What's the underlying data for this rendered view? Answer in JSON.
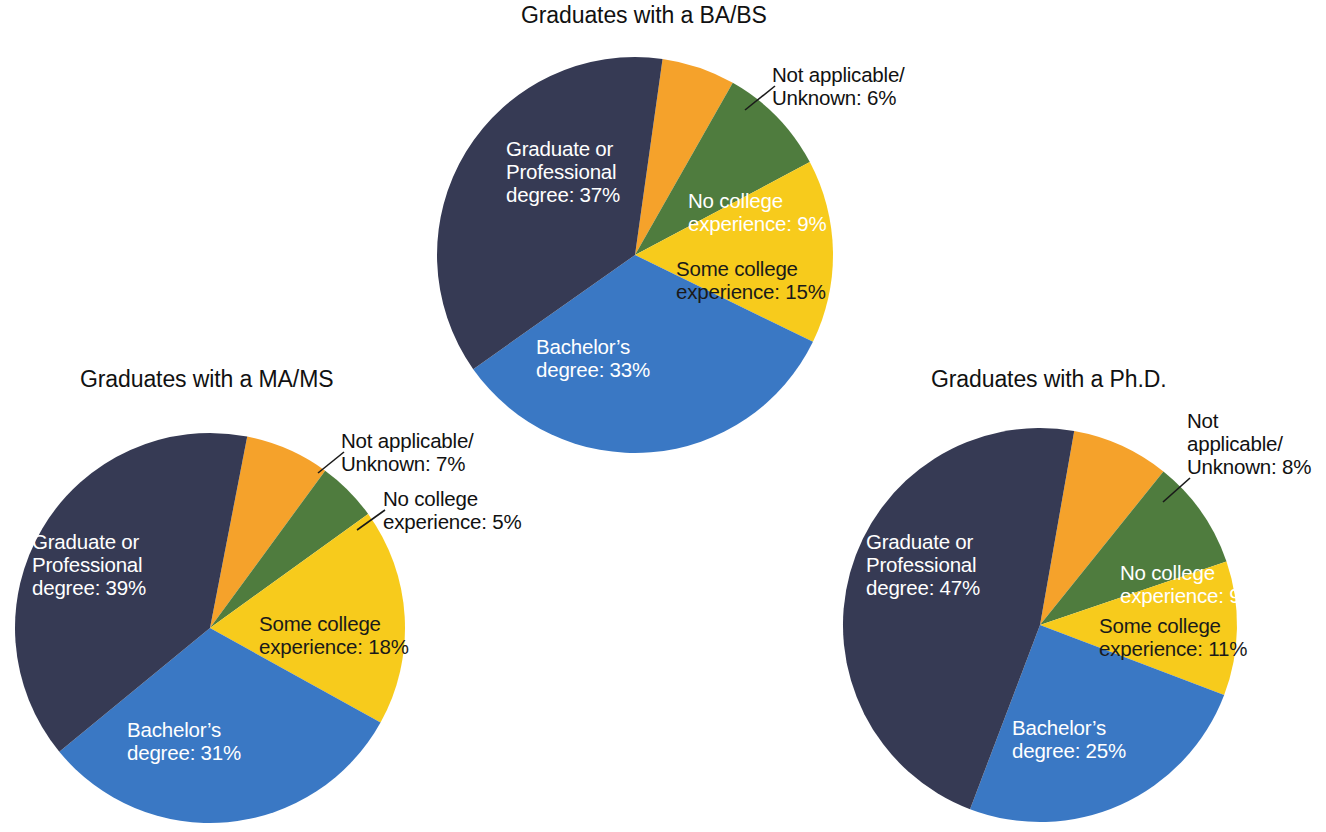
{
  "page": {
    "background": "#ffffff",
    "width": 1326,
    "height": 832
  },
  "palette": {
    "graduate_professional": "#363a54",
    "bachelors": "#3a78c4",
    "some_college": "#f7cb1c",
    "no_college": "#4f7c3e",
    "not_applicable": "#f5a22b",
    "text_dark": "#1a1a1a",
    "text_light": "#ffffff"
  },
  "charts": [
    {
      "id": "ba",
      "title": "Graduates with a BA/BS",
      "labels": {
        "grad_l1": "Graduate or",
        "grad_l2": "Professional",
        "grad_l3": "degree: 37%",
        "na_l1": "Not applicable/",
        "na_l2": "Unknown: 6%",
        "nocoll_l1": "No college",
        "nocoll_l2": "experience: 9%",
        "somecoll_l1": "Some college",
        "somecoll_l2": "experience: 15%",
        "bach_l1": "Bachelor’s",
        "bach_l2": "degree: 33%"
      }
    },
    {
      "id": "ma",
      "title": "Graduates with a MA/MS",
      "labels": {
        "grad_l1": "Graduate or",
        "grad_l2": "Professional",
        "grad_l3": "degree: 39%",
        "na_l1": "Not applicable/",
        "na_l2": "Unknown: 7%",
        "nocoll_l1": "No college",
        "nocoll_l2": "experience: 5%",
        "somecoll_l1": "Some college",
        "somecoll_l2": "experience: 18%",
        "bach_l1": "Bachelor’s",
        "bach_l2": "degree: 31%"
      }
    },
    {
      "id": "phd",
      "title": "Graduates with a Ph.D.",
      "labels": {
        "grad_l1": "Graduate or",
        "grad_l2": "Professional",
        "grad_l3": "degree: 47%",
        "na_l1": "Not",
        "na_l2": "applicable/",
        "na_l3": "Unknown:  8%",
        "nocoll_l1": "No college",
        "nocoll_l2": "experience: 9%",
        "somecoll_l1": "Some college",
        "somecoll_l2": "experience: 11%",
        "bach_l1": "Bachelor’s",
        "bach_l2": "degree: 25%"
      }
    }
  ],
  "chart_data": [
    {
      "type": "pie",
      "title": "Graduates with a BA/BS",
      "categories": [
        "Not applicable/Unknown",
        "No college experience",
        "Some college experience",
        "Bachelor's degree",
        "Graduate or Professional degree"
      ],
      "values": [
        6,
        9,
        15,
        33,
        37
      ],
      "unit": "%",
      "colors": [
        "#f5a22b",
        "#4f7c3e",
        "#f7cb1c",
        "#3a78c4",
        "#363a54"
      ],
      "start_angle_deg": 8,
      "direction": "clockwise",
      "legend": "none",
      "data_labels": true
    },
    {
      "type": "pie",
      "title": "Graduates with a MA/MS",
      "categories": [
        "Not applicable/Unknown",
        "No college experience",
        "Some college experience",
        "Bachelor's degree",
        "Graduate or Professional degree"
      ],
      "values": [
        7,
        5,
        18,
        31,
        39
      ],
      "unit": "%",
      "colors": [
        "#f5a22b",
        "#4f7c3e",
        "#f7cb1c",
        "#3a78c4",
        "#363a54"
      ],
      "start_angle_deg": 11,
      "direction": "clockwise",
      "legend": "none",
      "data_labels": true
    },
    {
      "type": "pie",
      "title": "Graduates with a Ph.D.",
      "categories": [
        "Not applicable/Unknown",
        "No college experience",
        "Some college experience",
        "Bachelor's degree",
        "Graduate or Professional degree"
      ],
      "values": [
        8,
        9,
        11,
        25,
        47
      ],
      "unit": "%",
      "colors": [
        "#f5a22b",
        "#4f7c3e",
        "#f7cb1c",
        "#3a78c4",
        "#363a54"
      ],
      "start_angle_deg": 10,
      "direction": "clockwise",
      "legend": "none",
      "data_labels": true
    }
  ]
}
